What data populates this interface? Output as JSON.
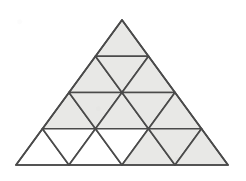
{
  "figure": {
    "background_color": "#ffffff",
    "shaded_fill": "#e8e8e6",
    "unshaded_fill": "#ffffff",
    "stroke_color": "#4a4a4a",
    "stroke_width": 1.7,
    "outer_triangle": {
      "apex": [
        122,
        20
      ],
      "bottom_left": [
        16,
        165
      ],
      "bottom_right": [
        228,
        165
      ],
      "rows": 4,
      "small_triangle_count": 16
    },
    "rows": [
      {
        "index": 1,
        "count": 1,
        "cells": [
          {
            "id": "r1c1",
            "orientation": "up",
            "shaded": true
          }
        ]
      },
      {
        "index": 2,
        "count": 3,
        "cells": [
          {
            "id": "r2c1",
            "orientation": "up",
            "shaded": true
          },
          {
            "id": "r2c2",
            "orientation": "down",
            "shaded": true
          },
          {
            "id": "r2c3",
            "orientation": "up",
            "shaded": true
          }
        ]
      },
      {
        "index": 3,
        "count": 5,
        "cells": [
          {
            "id": "r3c1",
            "orientation": "up",
            "shaded": true
          },
          {
            "id": "r3c2",
            "orientation": "down",
            "shaded": true
          },
          {
            "id": "r3c3",
            "orientation": "up",
            "shaded": true
          },
          {
            "id": "r3c4",
            "orientation": "down",
            "shaded": true
          },
          {
            "id": "r3c5",
            "orientation": "up",
            "shaded": true
          }
        ]
      },
      {
        "index": 4,
        "count": 7,
        "cells": [
          {
            "id": "r4c1",
            "orientation": "up",
            "shaded": false
          },
          {
            "id": "r4c2",
            "orientation": "down",
            "shaded": false
          },
          {
            "id": "r4c3",
            "orientation": "up",
            "shaded": false
          },
          {
            "id": "r4c4",
            "orientation": "down",
            "shaded": false
          },
          {
            "id": "r4c5",
            "orientation": "up",
            "shaded": true
          },
          {
            "id": "r4c6",
            "orientation": "down",
            "shaded": true
          },
          {
            "id": "r4c7",
            "orientation": "up",
            "shaded": true
          }
        ]
      }
    ]
  }
}
